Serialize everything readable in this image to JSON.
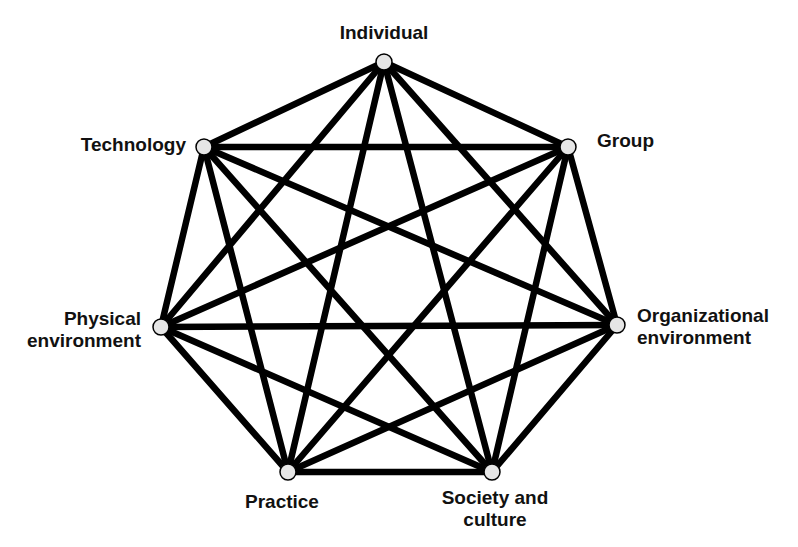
{
  "diagram": {
    "type": "complete-graph",
    "node_fill": "#e6e6e6",
    "edge_color": "#000000",
    "nodes": [
      {
        "id": "individual",
        "lines": [
          "Individual"
        ],
        "x": 384,
        "y": 62
      },
      {
        "id": "group",
        "lines": [
          "Group"
        ],
        "x": 568,
        "y": 147
      },
      {
        "id": "organizational-environment",
        "lines": [
          "Organizational",
          "environment"
        ],
        "x": 617,
        "y": 325
      },
      {
        "id": "society-and-culture",
        "lines": [
          "Society and",
          "culture"
        ],
        "x": 492,
        "y": 472
      },
      {
        "id": "practice",
        "lines": [
          "Practice"
        ],
        "x": 288,
        "y": 472
      },
      {
        "id": "physical-environment",
        "lines": [
          "Physical",
          "environment"
        ],
        "x": 161,
        "y": 327
      },
      {
        "id": "technology",
        "lines": [
          "Technology"
        ],
        "x": 204,
        "y": 147
      }
    ],
    "edges": "all-pairs"
  }
}
